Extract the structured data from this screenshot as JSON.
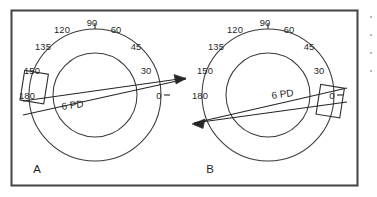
{
  "figure": {
    "background_color": "#ffffff",
    "frame_color": "#4a4a4a",
    "ink_color": "#262626",
    "width": 377,
    "height": 197
  },
  "panels": [
    {
      "id": "A",
      "letter": "A",
      "center_x": 95,
      "center_y": 95,
      "outer_radius": 66,
      "inner_radius": 42,
      "prism_value": "6 PD",
      "prism_label_x": 74,
      "prism_label_y": 107,
      "axis_angle_deg": 13,
      "prism_box_side": "left",
      "degree_labels": [
        {
          "text": "0",
          "x": 159,
          "y": 99
        },
        {
          "text": "30",
          "x": 146,
          "y": 74
        },
        {
          "text": "45",
          "x": 136,
          "y": 50
        },
        {
          "text": "60",
          "x": 116,
          "y": 33
        },
        {
          "text": "90",
          "x": 92,
          "y": 26
        },
        {
          "text": "120",
          "x": 62,
          "y": 33
        },
        {
          "text": "135",
          "x": 43,
          "y": 50
        },
        {
          "text": "150",
          "x": 32,
          "y": 74
        },
        {
          "text": "180",
          "x": 27,
          "y": 99
        }
      ]
    },
    {
      "id": "B",
      "letter": "B",
      "center_x": 268,
      "center_y": 95,
      "outer_radius": 66,
      "inner_radius": 42,
      "prism_value": "6 PD",
      "prism_label_x": 281,
      "prism_label_y": 96,
      "axis_angle_deg": 13,
      "prism_box_side": "right",
      "degree_labels": [
        {
          "text": "0",
          "x": 332,
          "y": 99
        },
        {
          "text": "30",
          "x": 319,
          "y": 74
        },
        {
          "text": "45",
          "x": 309,
          "y": 50
        },
        {
          "text": "60",
          "x": 289,
          "y": 33
        },
        {
          "text": "90",
          "x": 265,
          "y": 26
        },
        {
          "text": "120",
          "x": 235,
          "y": 33
        },
        {
          "text": "135",
          "x": 216,
          "y": 50
        },
        {
          "text": "150",
          "x": 205,
          "y": 74
        },
        {
          "text": "180",
          "x": 200,
          "y": 99
        }
      ]
    }
  ],
  "letters": {
    "a_x": 37,
    "a_y": 173,
    "b_x": 210,
    "b_y": 173
  }
}
